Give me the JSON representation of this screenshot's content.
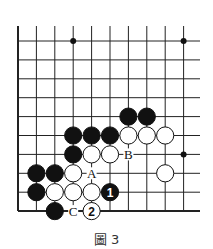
{
  "diagram": {
    "type": "go-board-fragment",
    "caption": "圖 3",
    "grid": {
      "cols": 10,
      "rows": 10,
      "x0": 18,
      "y0": 41,
      "dx": 18.4,
      "dy": 18.9,
      "right_extend": 200,
      "top_extend": 26,
      "left_edge": true,
      "bottom_edge": true
    },
    "colors": {
      "line": "#222222",
      "black": "#111111",
      "white": "#ffffff"
    },
    "star_points": [
      [
        3,
        0
      ],
      [
        9,
        0
      ],
      [
        9,
        6
      ]
    ],
    "stones": [
      {
        "col": 6,
        "row": 4,
        "color": "black"
      },
      {
        "col": 7,
        "row": 4,
        "color": "black"
      },
      {
        "col": 3,
        "row": 5,
        "color": "black"
      },
      {
        "col": 4,
        "row": 5,
        "color": "black"
      },
      {
        "col": 5,
        "row": 5,
        "color": "black"
      },
      {
        "col": 6,
        "row": 5,
        "color": "white"
      },
      {
        "col": 7,
        "row": 5,
        "color": "white"
      },
      {
        "col": 8,
        "row": 5,
        "color": "white"
      },
      {
        "col": 3,
        "row": 6,
        "color": "black"
      },
      {
        "col": 4,
        "row": 6,
        "color": "white"
      },
      {
        "col": 5,
        "row": 6,
        "color": "white"
      },
      {
        "col": 1,
        "row": 7,
        "color": "black"
      },
      {
        "col": 2,
        "row": 7,
        "color": "black"
      },
      {
        "col": 3,
        "row": 7,
        "color": "white"
      },
      {
        "col": 8,
        "row": 7,
        "color": "white"
      },
      {
        "col": 1,
        "row": 8,
        "color": "black"
      },
      {
        "col": 2,
        "row": 8,
        "color": "white"
      },
      {
        "col": 3,
        "row": 8,
        "color": "white"
      },
      {
        "col": 4,
        "row": 8,
        "color": "white"
      },
      {
        "col": 5,
        "row": 8,
        "color": "black",
        "label": "1"
      },
      {
        "col": 2,
        "row": 9,
        "color": "black"
      },
      {
        "col": 4,
        "row": 9,
        "color": "white",
        "label": "2"
      }
    ],
    "letters": [
      {
        "col": 6,
        "row": 6,
        "text": "B"
      },
      {
        "col": 4,
        "row": 7,
        "text": "A"
      },
      {
        "col": 3,
        "row": 9,
        "text": "C"
      }
    ]
  }
}
